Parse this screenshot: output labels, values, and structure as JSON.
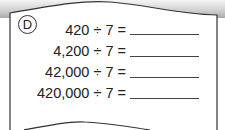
{
  "problem": {
    "label": "D",
    "rows": [
      {
        "expression": "420 ÷ 7 =",
        "answer": ""
      },
      {
        "expression": "4,200 ÷ 7 =",
        "answer": ""
      },
      {
        "expression": "42,000 ÷ 7 =",
        "answer": ""
      },
      {
        "expression": "420,000 ÷ 7 =",
        "answer": ""
      }
    ]
  }
}
